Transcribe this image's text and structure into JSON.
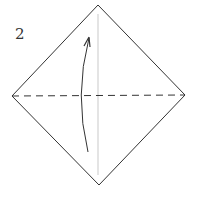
{
  "diagram": {
    "step_number": "2",
    "shape": "square-on-point",
    "vertices": {
      "top": [
        98,
        5
      ],
      "right": [
        185,
        95
      ],
      "bottom": [
        99,
        185
      ],
      "left": [
        12,
        96
      ]
    },
    "center_crease": {
      "type": "solid-light",
      "x": 98,
      "y1": 14,
      "y2": 175,
      "color": "#bbbbbb"
    },
    "valley_fold_line": {
      "type": "dashed",
      "from": [
        12,
        96
      ],
      "to": [
        185,
        95
      ],
      "color": "#333333"
    },
    "arrow": {
      "direction": "up",
      "curve": "bowed-left",
      "from": [
        88,
        152
      ],
      "to": [
        89,
        37
      ],
      "color": "#333333"
    },
    "colors": {
      "outline": "#333333",
      "background": "#ffffff"
    }
  }
}
